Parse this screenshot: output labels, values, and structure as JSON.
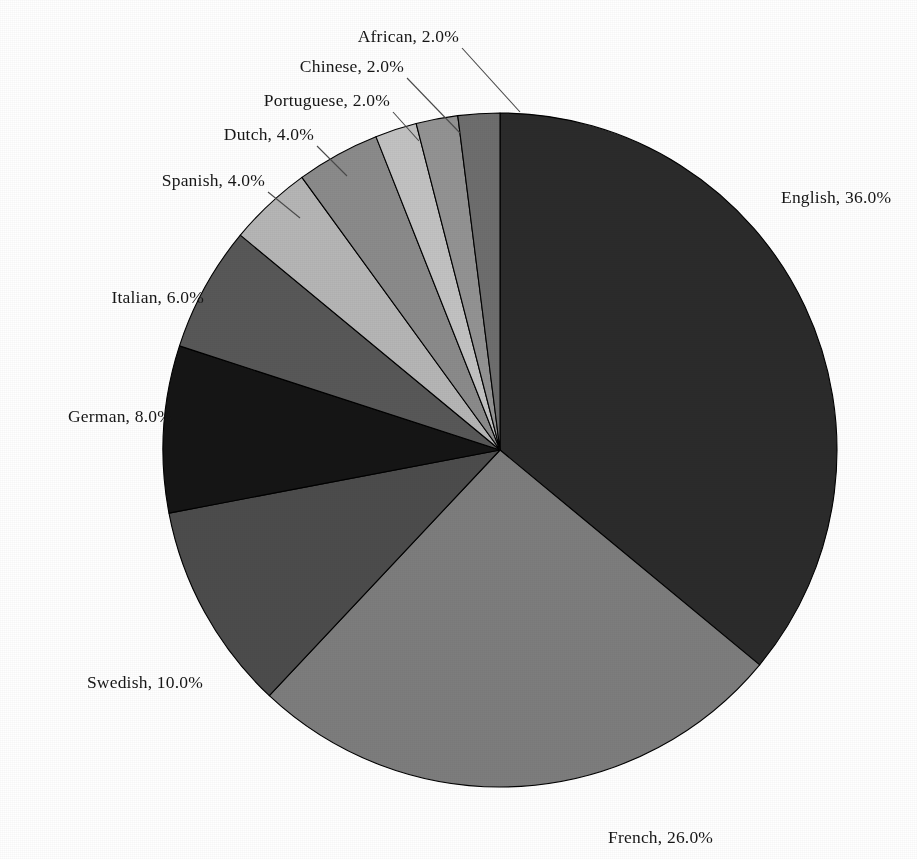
{
  "chart_data": {
    "type": "pie",
    "title": "",
    "title_partial_top": "",
    "xlabel": "",
    "ylabel": "",
    "legend_position": "none",
    "labels_show_name_and_percent": true,
    "label_separator": ", ",
    "start_angle_deg": 0,
    "direction": "clockwise",
    "categories": [
      "English",
      "French",
      "Swedish",
      "German",
      "Italian",
      "Spanish",
      "Dutch",
      "Portuguese",
      "Chinese",
      "African"
    ],
    "values": [
      36.0,
      26.0,
      10.0,
      8.0,
      6.0,
      4.0,
      4.0,
      2.0,
      2.0,
      2.0
    ],
    "total": 100.0,
    "slices": [
      {
        "name": "English",
        "value": 36.0,
        "value_label": "36.0%",
        "label": "English, 36.0%",
        "color": "#2b2b2b"
      },
      {
        "name": "French",
        "value": 26.0,
        "value_label": "26.0%",
        "label": "French, 26.0%",
        "color": "#7d7d7d"
      },
      {
        "name": "Swedish",
        "value": 10.0,
        "value_label": "10.0%",
        "label": "Swedish, 10.0%",
        "color": "#4c4c4c"
      },
      {
        "name": "German",
        "value": 8.0,
        "value_label": "8.0%",
        "label": "German, 8.0%",
        "color": "#151515"
      },
      {
        "name": "Italian",
        "value": 6.0,
        "value_label": "6.0%",
        "label": "Italian, 6.0%",
        "color": "#585858"
      },
      {
        "name": "Spanish",
        "value": 4.0,
        "value_label": "4.0%",
        "label": "Spanish, 4.0%",
        "color": "#b6b6b6"
      },
      {
        "name": "Dutch",
        "value": 4.0,
        "value_label": "4.0%",
        "label": "Dutch, 4.0%",
        "color": "#8b8b8b"
      },
      {
        "name": "Portuguese",
        "value": 2.0,
        "value_label": "2.0%",
        "label": "Portuguese, 2.0%",
        "color": "#c2c2c2"
      },
      {
        "name": "Chinese",
        "value": 2.0,
        "value_label": "2.0%",
        "label": "Chinese, 2.0%",
        "color": "#939393"
      },
      {
        "name": "African",
        "value": 2.0,
        "value_label": "2.0%",
        "label": "African, 2.0%",
        "color": "#6e6e6e"
      }
    ],
    "geometry": {
      "center_x": 500,
      "center_y": 450,
      "radius": 337
    },
    "label_positions": [
      {
        "name": "English",
        "x": 781,
        "y": 203,
        "anchor": "start",
        "leader": false
      },
      {
        "name": "French",
        "x": 608,
        "y": 843,
        "anchor": "start",
        "leader": false
      },
      {
        "name": "Swedish",
        "x": 203,
        "y": 688,
        "anchor": "end",
        "leader": false
      },
      {
        "name": "German",
        "x": 172,
        "y": 422,
        "anchor": "end",
        "leader": false
      },
      {
        "name": "Italian",
        "x": 204,
        "y": 303,
        "anchor": "end",
        "leader": false
      },
      {
        "name": "Spanish",
        "x": 265,
        "y": 186,
        "anchor": "end",
        "leader": true,
        "leader_path": "M 268 192 L 300 218"
      },
      {
        "name": "Dutch",
        "x": 314,
        "y": 140,
        "anchor": "end",
        "leader": true,
        "leader_path": "M 317 146 L 347 176"
      },
      {
        "name": "Portuguese",
        "x": 390,
        "y": 106,
        "anchor": "end",
        "leader": true,
        "leader_path": "M 393 112 L 419 141"
      },
      {
        "name": "Chinese",
        "x": 404,
        "y": 72,
        "anchor": "end",
        "leader": true,
        "leader_path": "M 407 78 L 460 133"
      },
      {
        "name": "African",
        "x": 459,
        "y": 42,
        "anchor": "end",
        "leader": true,
        "leader_path": "M 462 48 L 520 112"
      }
    ],
    "background_color": "#ffffff",
    "slice_border_color": "#000000",
    "text_color": "#161616"
  },
  "page": {
    "alt_description": "Grayscale pie chart of language shares"
  }
}
